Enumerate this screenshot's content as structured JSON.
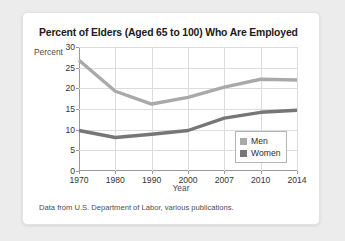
{
  "card": {
    "title": "Percent of Elders (Aged 65 to 100) Who Are Employed",
    "source_note": "Data from U.S. Department of Labor, various publications."
  },
  "legend": {
    "men_label": "Men",
    "women_label": "Women"
  },
  "colors": {
    "men": "#a9a9a9",
    "women": "#767676",
    "grid": "#dcdcdc",
    "axis": "#9a9a9a",
    "card_bg": "#ffffff",
    "page_bg": "#ececed",
    "title": "#1b1b1b"
  },
  "chart_data": {
    "type": "line",
    "title": "Percent of Elders (Aged 65 to 100) Who Are Employed",
    "xlabel": "Year",
    "ylabel": "Percent",
    "categories": [
      "1970",
      "1980",
      "1990",
      "2000",
      "2007",
      "2010",
      "2014"
    ],
    "yticks": [
      0,
      5,
      10,
      15,
      20,
      25,
      30
    ],
    "ylim": [
      0,
      30
    ],
    "grid": true,
    "legend_position": "bottom-right-inside",
    "series": [
      {
        "name": "Men",
        "color": "#a9a9a9",
        "values": [
          26.8,
          19.3,
          16.2,
          17.8,
          20.3,
          22.2,
          22.0
        ]
      },
      {
        "name": "Women",
        "color": "#767676",
        "values": [
          9.8,
          8.1,
          8.9,
          9.8,
          12.8,
          14.2,
          14.7
        ]
      }
    ]
  }
}
